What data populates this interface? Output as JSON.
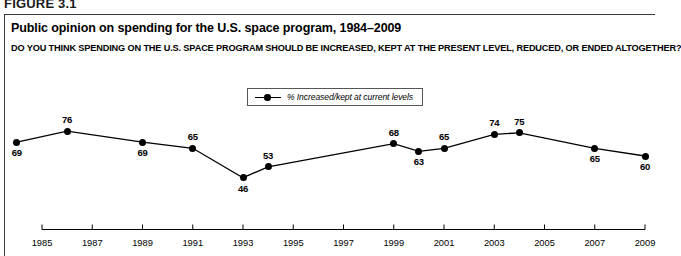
{
  "figure_tag": "FIGURE 3.1",
  "title": "Public opinion on spending for the U.S. space program, 1984–2009",
  "subtitle": "DO YOU THINK SPENDING ON THE U.S. SPACE PROGRAM SHOULD BE INCREASED, KEPT AT THE PRESENT LEVEL, REDUCED, OR ENDED ALTOGETHER?",
  "legend": {
    "label": "% Increased/kept at current levels",
    "marker": "line-with-dot-marker"
  },
  "chart_data": {
    "type": "line",
    "title": "Public opinion on spending for the U.S. space program, 1984–2009",
    "subtitle": "DO YOU THINK SPENDING ON THE U.S. SPACE PROGRAM SHOULD BE INCREASED, KEPT AT THE PRESENT LEVEL, REDUCED, OR ENDED ALTOGETHER?",
    "xlabel": "",
    "ylabel": "",
    "grid": false,
    "legend_position": "top-center",
    "axis_ticks": [
      "1985",
      "1987",
      "1989",
      "1991",
      "1993",
      "1995",
      "1997",
      "1999",
      "2001",
      "2003",
      "2005",
      "2007",
      "2009"
    ],
    "xlim": [
      1984,
      2009
    ],
    "ylim": [
      40,
      80
    ],
    "series": [
      {
        "name": "% Increased/kept at current levels",
        "color": "#000000",
        "x": [
          1984,
          1986,
          1989,
          1991,
          1993,
          1994,
          1999,
          2000,
          2001,
          2003,
          2004,
          2007,
          2009
        ],
        "values": [
          69,
          76,
          69,
          65,
          46,
          53,
          68,
          63,
          65,
          74,
          75,
          65,
          60
        ],
        "label_positions": [
          "below",
          "above",
          "below",
          "above",
          "below",
          "above",
          "above",
          "below",
          "above",
          "above",
          "above",
          "below",
          "below"
        ]
      }
    ]
  }
}
